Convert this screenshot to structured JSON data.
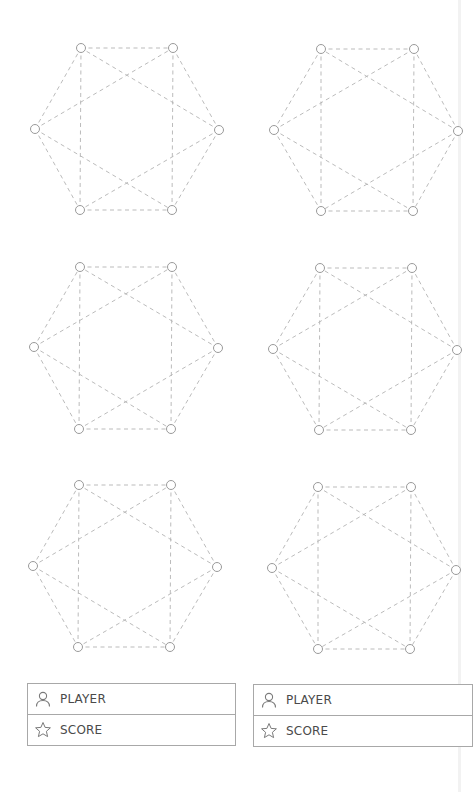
{
  "boards": [
    {
      "id": "board-1",
      "nodes": [
        [
          81,
          48
        ],
        [
          173,
          48
        ],
        [
          35,
          129
        ],
        [
          219,
          130
        ],
        [
          80,
          210
        ],
        [
          172,
          210
        ]
      ]
    },
    {
      "id": "board-2",
      "nodes": [
        [
          321,
          49
        ],
        [
          414,
          49
        ],
        [
          274,
          130
        ],
        [
          458,
          131
        ],
        [
          321,
          211
        ],
        [
          413,
          211
        ]
      ]
    },
    {
      "id": "board-3",
      "nodes": [
        [
          80,
          267
        ],
        [
          172,
          267
        ],
        [
          34,
          347
        ],
        [
          218,
          348
        ],
        [
          79,
          429
        ],
        [
          171,
          429
        ]
      ]
    },
    {
      "id": "board-4",
      "nodes": [
        [
          320,
          268
        ],
        [
          412,
          268
        ],
        [
          273,
          349
        ],
        [
          457,
          350
        ],
        [
          319,
          430
        ],
        [
          411,
          430
        ]
      ]
    },
    {
      "id": "board-5",
      "nodes": [
        [
          79,
          485
        ],
        [
          171,
          485
        ],
        [
          33,
          566
        ],
        [
          217,
          567
        ],
        [
          78,
          647
        ],
        [
          170,
          647
        ]
      ]
    },
    {
      "id": "board-6",
      "nodes": [
        [
          318,
          487
        ],
        [
          411,
          487
        ],
        [
          272,
          568
        ],
        [
          456,
          570
        ],
        [
          318,
          649
        ],
        [
          410,
          649
        ]
      ]
    }
  ],
  "edges": [
    [
      0,
      1
    ],
    [
      0,
      4
    ],
    [
      1,
      5
    ],
    [
      4,
      5
    ],
    [
      2,
      0
    ],
    [
      2,
      4
    ],
    [
      3,
      1
    ],
    [
      3,
      5
    ],
    [
      2,
      1
    ],
    [
      2,
      5
    ],
    [
      3,
      0
    ],
    [
      3,
      4
    ]
  ],
  "cards": [
    {
      "player_label": "PLAYER",
      "player_icon": "person-icon",
      "score_label": "SCORE",
      "score_icon": "star-icon"
    },
    {
      "player_label": "PLAYER",
      "player_icon": "person-icon",
      "score_label": "SCORE",
      "score_icon": "star-icon"
    }
  ],
  "colors": {
    "edge": "#b3b3b3",
    "node_stroke": "#9a9a9a",
    "card_border": "#a8a8a8",
    "text": "#4a4a4a"
  }
}
